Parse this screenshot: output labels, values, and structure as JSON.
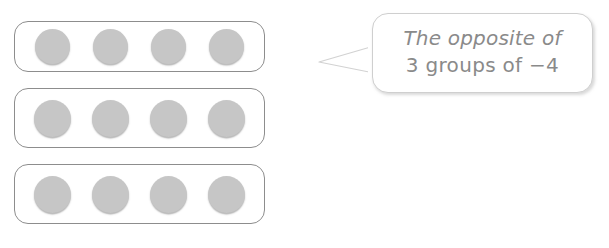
{
  "diagram": {
    "counter_fill_color": "#c6c6c6",
    "group_border_color": "#8d8d8d",
    "background_color": "#ffffff",
    "groups": [
      {
        "label": "group-1",
        "counter_count": 4,
        "counters": [
          "counter",
          "counter",
          "counter",
          "counter"
        ]
      },
      {
        "label": "group-2",
        "counter_count": 4,
        "counters": [
          "counter",
          "counter",
          "counter",
          "counter"
        ]
      },
      {
        "label": "group-3",
        "counter_count": 4,
        "counters": [
          "counter",
          "counter",
          "counter",
          "counter"
        ]
      }
    ]
  },
  "callout": {
    "text_color": "#8a8a8a",
    "border_color": "#cfcfcf",
    "line1": "The opposite of",
    "line2": "3 groups of −4",
    "full_text": "The opposite of 3 groups of −4"
  }
}
